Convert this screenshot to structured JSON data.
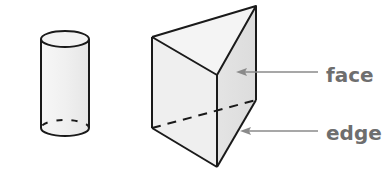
{
  "figure": {
    "shapes": [
      {
        "name": "cylinder"
      },
      {
        "name": "triangular-prism"
      }
    ],
    "labels": {
      "face": "face",
      "edge": "edge"
    },
    "colors": {
      "outline": "#1a1a1a",
      "fill_light": "#f2f2f2",
      "fill_shade": "#e2e2e2",
      "pointer": "#8a8a8a",
      "label": "#6e6e6e"
    }
  }
}
